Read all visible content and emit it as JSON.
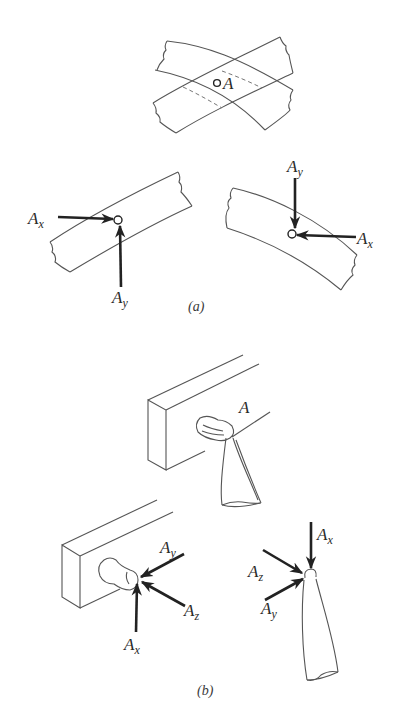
{
  "figure": {
    "part_a": {
      "caption": "(a)",
      "overview": {
        "point_label": "A"
      },
      "left_detail": {
        "forces": [
          {
            "name": "A",
            "sub": "x"
          },
          {
            "name": "A",
            "sub": "y"
          }
        ]
      },
      "right_detail": {
        "forces": [
          {
            "name": "A",
            "sub": "y"
          },
          {
            "name": "A",
            "sub": "x"
          }
        ]
      }
    },
    "part_b": {
      "caption": "(b)",
      "overview": {
        "point_label": "A"
      },
      "left_detail": {
        "forces": [
          {
            "name": "A",
            "sub": "y"
          },
          {
            "name": "A",
            "sub": "z"
          },
          {
            "name": "A",
            "sub": "x"
          }
        ]
      },
      "right_detail": {
        "forces": [
          {
            "name": "A",
            "sub": "x"
          },
          {
            "name": "A",
            "sub": "z"
          },
          {
            "name": "A",
            "sub": "y"
          }
        ]
      }
    }
  }
}
